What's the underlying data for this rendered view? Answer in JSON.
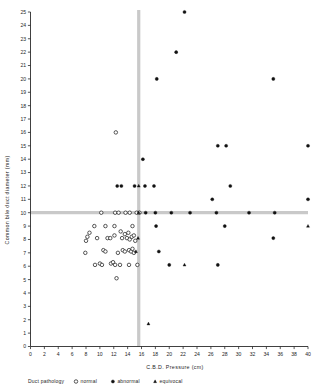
{
  "chart_data": {
    "type": "scatter",
    "title": "",
    "xlabel": "C.B.D.  Pressure  (cm)",
    "ylabel": "Common bile duct diameter (mm)",
    "xlim": [
      0,
      40
    ],
    "ylim": [
      0,
      25
    ],
    "xticks": [
      0,
      2,
      4,
      6,
      8,
      10,
      12,
      14,
      16,
      18,
      20,
      22,
      24,
      26,
      28,
      30,
      32,
      34,
      36,
      38,
      40
    ],
    "yticks": [
      0,
      1,
      2,
      3,
      4,
      5,
      6,
      7,
      8,
      9,
      10,
      11,
      12,
      13,
      14,
      15,
      16,
      17,
      18,
      19,
      20,
      21,
      22,
      23,
      24,
      25
    ],
    "xtick_labels": [
      "0",
      "2",
      "4",
      "6",
      "8",
      "10",
      "12",
      "14",
      "16",
      "18",
      "20",
      "22",
      "24",
      "26",
      "28",
      "30",
      "32",
      "34",
      "36",
      "38",
      "40"
    ],
    "ytick_labels": [
      "0",
      "1",
      "2",
      "3",
      "4",
      "5",
      "6",
      "7",
      "8",
      "9",
      "10",
      "11",
      "12",
      "13",
      "14",
      "15",
      "16",
      "17",
      "18",
      "19",
      "20",
      "21",
      "22",
      "23",
      "24",
      "25"
    ],
    "grid": false,
    "reference_lines": [
      {
        "orientation": "vertical",
        "value": 15.6,
        "color": "#c9c9c9"
      },
      {
        "orientation": "horizontal",
        "value": 10.0,
        "color": "#c9c9c9"
      }
    ],
    "legend_position": "below-axis",
    "legend_title": "Duct pathology",
    "series": [
      {
        "name": "normal",
        "marker": "open-circle",
        "color": "#202020",
        "points": [
          [
            12.3,
            16.0
          ],
          [
            10.2,
            10.0
          ],
          [
            12.2,
            10.0
          ],
          [
            12.7,
            10.0
          ],
          [
            13.7,
            10.0
          ],
          [
            14.3,
            10.0
          ],
          [
            15.3,
            10.0
          ],
          [
            15.7,
            10.0
          ],
          [
            9.2,
            9.0
          ],
          [
            10.8,
            9.0
          ],
          [
            12.1,
            9.0
          ],
          [
            14.7,
            9.0
          ],
          [
            8.2,
            8.2
          ],
          [
            8.5,
            8.5
          ],
          [
            8.0,
            7.9
          ],
          [
            9.6,
            8.1
          ],
          [
            11.1,
            8.1
          ],
          [
            11.5,
            8.1
          ],
          [
            12.1,
            8.3
          ],
          [
            13.0,
            8.6
          ],
          [
            13.2,
            8.1
          ],
          [
            13.6,
            8.4
          ],
          [
            13.9,
            8.1
          ],
          [
            14.1,
            8.5
          ],
          [
            14.3,
            8.0
          ],
          [
            14.6,
            8.2
          ],
          [
            14.9,
            8.3
          ],
          [
            15.1,
            7.9
          ],
          [
            7.9,
            7.0
          ],
          [
            10.5,
            7.2
          ],
          [
            10.8,
            7.1
          ],
          [
            12.6,
            7.0
          ],
          [
            13.3,
            7.2
          ],
          [
            13.6,
            7.1
          ],
          [
            14.2,
            7.2
          ],
          [
            14.5,
            7.1
          ],
          [
            14.7,
            7.3
          ],
          [
            14.9,
            7.0
          ],
          [
            9.3,
            6.1
          ],
          [
            10.0,
            6.2
          ],
          [
            10.3,
            6.1
          ],
          [
            11.6,
            6.2
          ],
          [
            11.9,
            6.3
          ],
          [
            12.2,
            6.1
          ],
          [
            12.9,
            6.1
          ],
          [
            14.2,
            6.1
          ],
          [
            15.4,
            6.1
          ],
          [
            12.4,
            5.1
          ]
        ]
      },
      {
        "name": "abnormal",
        "marker": "filled-circle",
        "color": "#111111",
        "points": [
          [
            22.2,
            25.0
          ],
          [
            21.0,
            22.0
          ],
          [
            18.2,
            20.0
          ],
          [
            35.0,
            20.0
          ],
          [
            27.0,
            15.0
          ],
          [
            28.2,
            15.0
          ],
          [
            40.0,
            15.0
          ],
          [
            16.2,
            14.0
          ],
          [
            12.5,
            12.0
          ],
          [
            13.1,
            12.0
          ],
          [
            15.0,
            12.0
          ],
          [
            16.5,
            12.0
          ],
          [
            17.8,
            12.0
          ],
          [
            28.8,
            12.0
          ],
          [
            26.2,
            11.0
          ],
          [
            40.0,
            11.0
          ],
          [
            16.6,
            10.0
          ],
          [
            18.0,
            10.0
          ],
          [
            20.3,
            10.0
          ],
          [
            23.0,
            10.0
          ],
          [
            26.8,
            10.0
          ],
          [
            31.5,
            10.0
          ],
          [
            35.2,
            10.0
          ],
          [
            18.1,
            9.0
          ],
          [
            28.0,
            9.0
          ],
          [
            35.0,
            8.1
          ],
          [
            18.5,
            7.1
          ],
          [
            20.0,
            6.1
          ],
          [
            27.0,
            6.1
          ]
        ]
      },
      {
        "name": "equivocal",
        "marker": "filled-triangle",
        "color": "#111111",
        "points": [
          [
            40.0,
            9.0
          ],
          [
            15.6,
            12.0
          ],
          [
            15.6,
            10.0
          ],
          [
            15.5,
            8.1
          ],
          [
            15.2,
            7.1
          ],
          [
            22.2,
            6.1
          ],
          [
            17.0,
            1.7
          ]
        ]
      }
    ]
  },
  "legend": {
    "title": "Duct pathology",
    "entries": [
      {
        "label": "normal",
        "marker": "open-circle"
      },
      {
        "label": "abnormal",
        "marker": "filled-circle"
      },
      {
        "label": "equivocal",
        "marker": "filled-triangle"
      }
    ]
  }
}
